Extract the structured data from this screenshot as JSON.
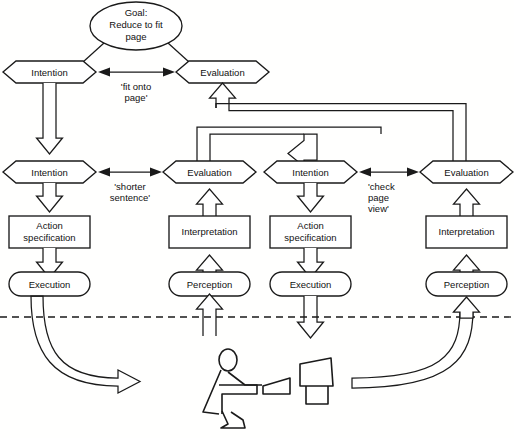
{
  "diagram": {
    "goal": {
      "line1": "Goal:",
      "line2": "Reduce to fit",
      "line3": "page"
    },
    "columns": [
      {
        "id": "col-left-execution",
        "nodes": [
          {
            "id": "intention-top",
            "label": "Intention",
            "shape": "hexagon"
          },
          {
            "id": "intention-mid",
            "label": "Intention",
            "shape": "hexagon"
          },
          {
            "id": "action-specification",
            "label_line1": "Action",
            "label_line2": "specification",
            "shape": "rect"
          },
          {
            "id": "execution",
            "label": "Execution",
            "shape": "rounded"
          }
        ]
      },
      {
        "id": "col-left-evaluation",
        "nodes": [
          {
            "id": "evaluation-top",
            "label": "Evaluation",
            "shape": "hexagon"
          },
          {
            "id": "evaluation-mid",
            "label": "Evaluation",
            "shape": "hexagon"
          },
          {
            "id": "interpretation",
            "label": "Interpretation",
            "shape": "rect"
          },
          {
            "id": "perception",
            "label": "Perception",
            "shape": "rounded"
          }
        ]
      },
      {
        "id": "col-right-execution",
        "nodes": [
          {
            "id": "intention-right",
            "label": "Intention",
            "shape": "hexagon"
          },
          {
            "id": "action-specification-right",
            "label_line1": "Action",
            "label_line2": "specification",
            "shape": "rect"
          },
          {
            "id": "execution-right",
            "label": "Execution",
            "shape": "rounded"
          }
        ]
      },
      {
        "id": "col-right-evaluation",
        "nodes": [
          {
            "id": "evaluation-right",
            "label": "Evaluation",
            "shape": "hexagon"
          },
          {
            "id": "interpretation-right",
            "label": "Interpretation",
            "shape": "rect"
          },
          {
            "id": "perception-right",
            "label": "Perception",
            "shape": "rounded"
          }
        ]
      }
    ],
    "gulf_labels": [
      {
        "id": "gulf-1",
        "line1": "'fit onto",
        "line2": "page'",
        "line3": ""
      },
      {
        "id": "gulf-2",
        "line1": "'shorter",
        "line2": "sentence'",
        "line3": ""
      },
      {
        "id": "gulf-3",
        "line1": "'check",
        "line2": "page",
        "line3": "view'"
      }
    ],
    "world_divider": {
      "id": "world-divider",
      "style": "dashed"
    },
    "actor": {
      "id": "user-at-workstation",
      "parts": [
        "person",
        "desk",
        "keyboard",
        "monitor"
      ]
    },
    "colors": {
      "stroke": "#1a1a1a",
      "fill": "#ffffff",
      "background": "#fffffe"
    }
  }
}
